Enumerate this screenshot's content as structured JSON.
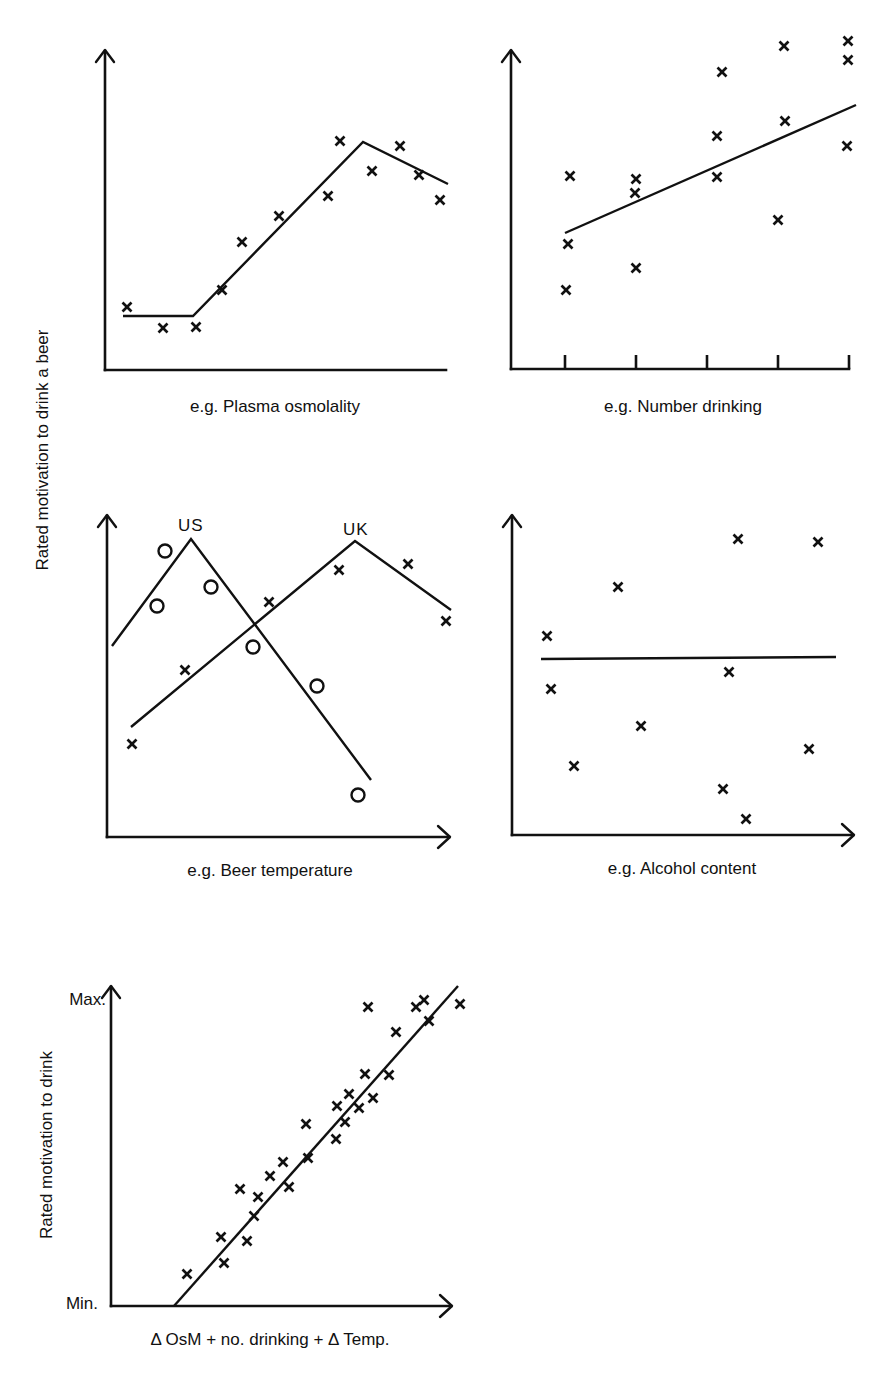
{
  "figure": {
    "shared_ylabel": "Rated motivation to drink a beer",
    "colors": {
      "ink": "#111111",
      "background": "#ffffff"
    }
  },
  "chart_data": [
    {
      "id": "panel-osmolality",
      "type": "scatter",
      "title": "",
      "xlabel": "e.g. Plasma osmolality",
      "ylabel": "Rated motivation to drink a beer",
      "grid": false,
      "axes": {
        "origin": [
          105,
          370
        ],
        "x_end": 446,
        "y_top": 50,
        "x_arrow": false,
        "y_arrow": true
      },
      "points": [
        [
          127,
          307
        ],
        [
          163,
          328
        ],
        [
          196,
          327
        ],
        [
          222,
          290
        ],
        [
          242,
          242
        ],
        [
          279,
          216
        ],
        [
          328,
          196
        ],
        [
          340,
          141
        ],
        [
          372,
          171
        ],
        [
          400,
          146
        ],
        [
          419,
          175
        ],
        [
          440,
          200
        ]
      ],
      "fit_line": [
        [
          123,
          316
        ],
        [
          193,
          316
        ],
        [
          363,
          142
        ],
        [
          448,
          184
        ]
      ],
      "fit_description": "flat baseline, linear rise, peak, slight decline"
    },
    {
      "id": "panel-number-drinking",
      "type": "scatter",
      "title": "",
      "xlabel": "e.g. Number drinking",
      "ylabel": "Rated motivation to drink a beer",
      "grid": false,
      "axes": {
        "origin": [
          511,
          369
        ],
        "x_end": 849,
        "y_top": 50,
        "x_arrow": false,
        "y_arrow": true
      },
      "x_ticks": [
        565,
        636,
        707,
        778,
        849
      ],
      "points": [
        [
          570,
          176
        ],
        [
          568,
          244
        ],
        [
          566,
          290
        ],
        [
          636,
          179
        ],
        [
          635,
          193
        ],
        [
          636,
          268
        ],
        [
          722,
          72
        ],
        [
          717,
          136
        ],
        [
          717,
          177
        ],
        [
          784,
          46
        ],
        [
          785,
          121
        ],
        [
          778,
          220
        ],
        [
          848,
          41
        ],
        [
          848,
          60
        ],
        [
          847,
          146
        ]
      ],
      "fit_line": [
        [
          565,
          233
        ],
        [
          856,
          105
        ]
      ],
      "fit_description": "positive linear trend"
    },
    {
      "id": "panel-beer-temperature",
      "type": "scatter",
      "title": "",
      "xlabel": "e.g. Beer temperature",
      "ylabel": "Rated motivation to drink a beer",
      "grid": false,
      "axes": {
        "origin": [
          107,
          837
        ],
        "x_end": 450,
        "y_top": 515,
        "x_arrow": true,
        "y_arrow": true
      },
      "series": [
        {
          "name": "US",
          "marker": "circle",
          "label_pos": [
            178,
            531
          ],
          "points": [
            [
              165,
              551
            ],
            [
              157,
              606
            ],
            [
              211,
              587
            ],
            [
              253,
              647
            ],
            [
              317,
              686
            ],
            [
              358,
              795
            ]
          ],
          "fit_line": [
            [
              112,
              646
            ],
            [
              191,
              539
            ],
            [
              371,
              780
            ]
          ]
        },
        {
          "name": "UK",
          "marker": "x",
          "label_pos": [
            343,
            535
          ],
          "points": [
            [
              132,
              744
            ],
            [
              185,
              670
            ],
            [
              269,
              602
            ],
            [
              339,
              570
            ],
            [
              408,
              564
            ],
            [
              446,
              621
            ]
          ],
          "fit_line": [
            [
              131,
              727
            ],
            [
              355,
              541
            ],
            [
              451,
              610
            ]
          ]
        }
      ],
      "fit_description": "inverted-V relationships with different optima for US and UK"
    },
    {
      "id": "panel-alcohol-content",
      "type": "scatter",
      "title": "",
      "xlabel": "e.g. Alcohol content",
      "ylabel": "Rated motivation to drink a beer",
      "grid": false,
      "axes": {
        "origin": [
          512,
          835
        ],
        "x_end": 854,
        "y_top": 515,
        "x_arrow": true,
        "y_arrow": true
      },
      "points": [
        [
          547,
          636
        ],
        [
          551,
          689
        ],
        [
          574,
          766
        ],
        [
          618,
          587
        ],
        [
          641,
          726
        ],
        [
          738,
          539
        ],
        [
          729,
          672
        ],
        [
          723,
          789
        ],
        [
          746,
          819
        ],
        [
          818,
          542
        ],
        [
          809,
          749
        ]
      ],
      "fit_line": [
        [
          541,
          659
        ],
        [
          836,
          657
        ]
      ],
      "fit_description": "flat line, no relationship"
    },
    {
      "id": "panel-combined",
      "type": "scatter",
      "title": "",
      "xlabel": "Δ OsM + no. drinking + Δ Temp.",
      "ylabel": "Rated motivation to drink",
      "y_tick_labels": {
        "max": "Max.",
        "min": "Min."
      },
      "grid": false,
      "axes": {
        "origin": [
          111,
          1306
        ],
        "x_end": 452,
        "y_top": 986,
        "x_arrow": true,
        "y_arrow": true
      },
      "points": [
        [
          187,
          1274
        ],
        [
          221,
          1237
        ],
        [
          224,
          1263
        ],
        [
          240,
          1189
        ],
        [
          247,
          1241
        ],
        [
          254,
          1216
        ],
        [
          258,
          1197
        ],
        [
          270,
          1176
        ],
        [
          283,
          1162
        ],
        [
          289,
          1187
        ],
        [
          306,
          1124
        ],
        [
          308,
          1158
        ],
        [
          336,
          1139
        ],
        [
          337,
          1106
        ],
        [
          345,
          1122
        ],
        [
          349,
          1094
        ],
        [
          359,
          1108
        ],
        [
          365,
          1074
        ],
        [
          373,
          1098
        ],
        [
          368,
          1007
        ],
        [
          389,
          1075
        ],
        [
          396,
          1032
        ],
        [
          416,
          1007
        ],
        [
          424,
          1000
        ],
        [
          429,
          1021
        ],
        [
          460,
          1004
        ]
      ],
      "fit_line": [
        [
          174,
          1306
        ],
        [
          458,
          986
        ]
      ],
      "fit_description": "strong positive linear relationship"
    }
  ]
}
